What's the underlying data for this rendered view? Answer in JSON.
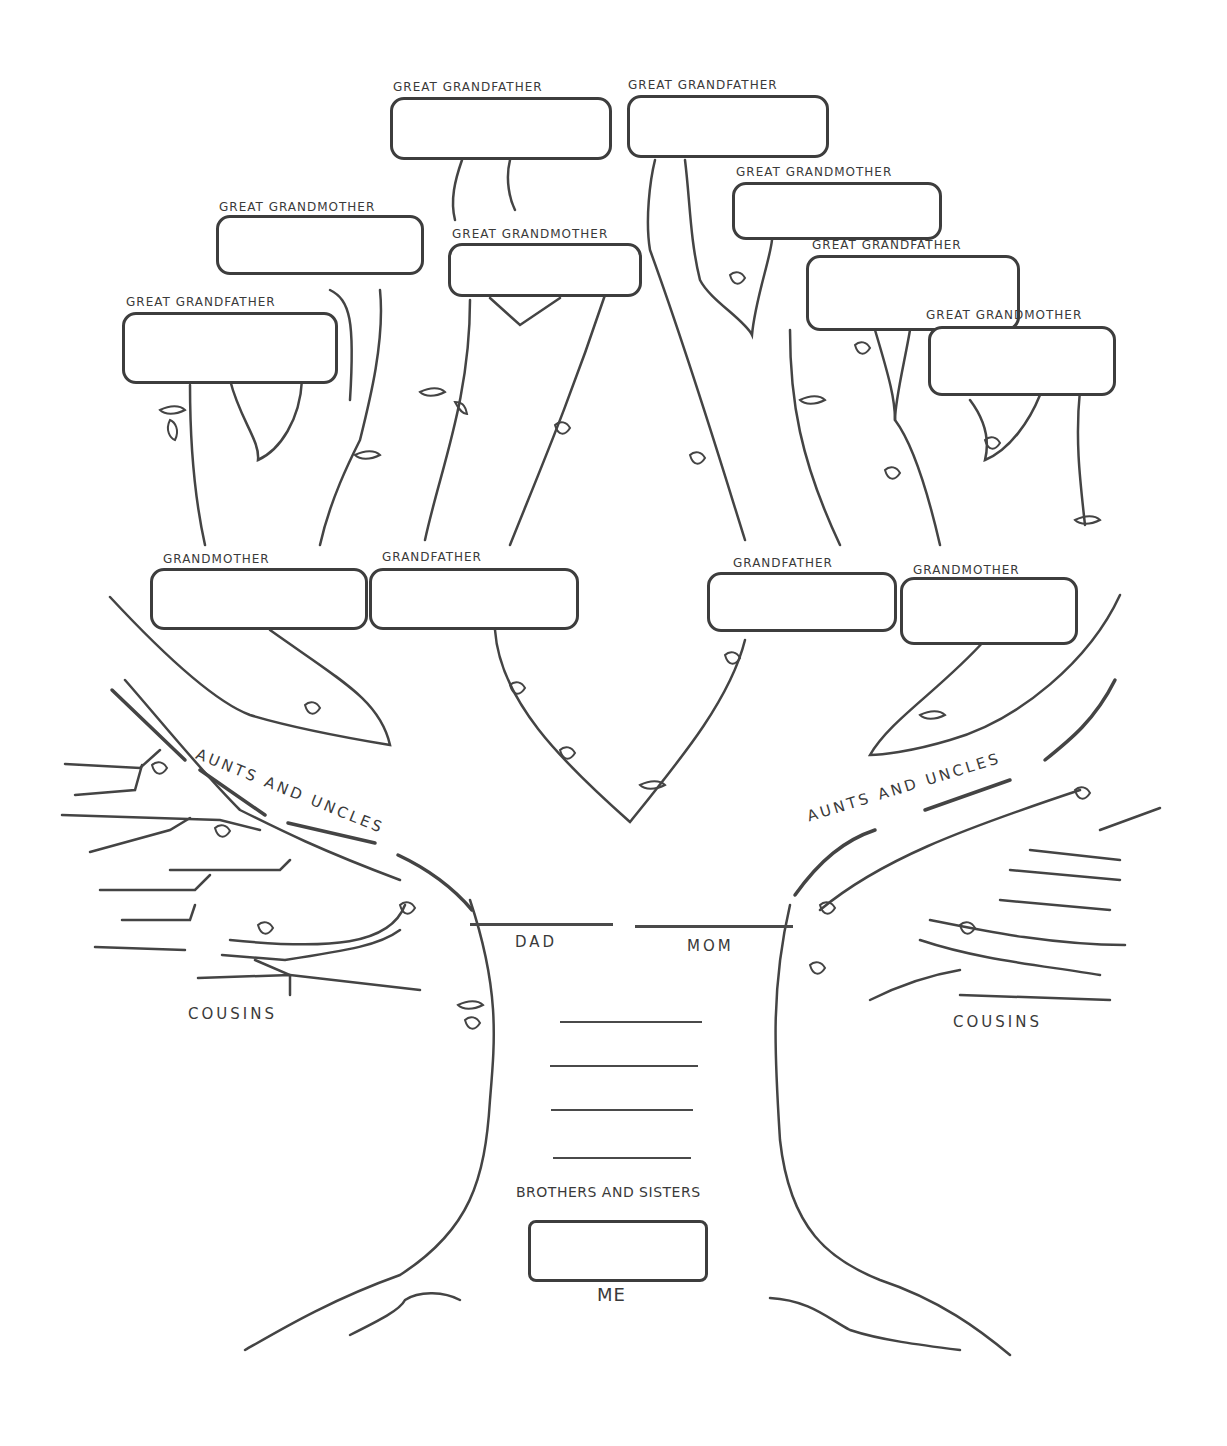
{
  "great_grandparents": [
    {
      "id": "gg1",
      "label": "GREAT GRANDFATHER"
    },
    {
      "id": "gg2",
      "label": "GREAT GRANDMOTHER"
    },
    {
      "id": "gg3",
      "label": "GREAT GRANDMOTHER"
    },
    {
      "id": "gg4",
      "label": "GREAT GRANDFATHER"
    },
    {
      "id": "gg5",
      "label": "GREAT GRANDFATHER"
    },
    {
      "id": "gg6",
      "label": "GREAT GRANDMOTHER"
    },
    {
      "id": "gg7",
      "label": "GREAT GRANDFATHER"
    },
    {
      "id": "gg8",
      "label": "GREAT GRANDMOTHER"
    }
  ],
  "grandparents": [
    {
      "id": "gp1",
      "label": "GRANDMOTHER"
    },
    {
      "id": "gp2",
      "label": "GRANDFATHER"
    },
    {
      "id": "gp3",
      "label": "GRANDFATHER"
    },
    {
      "id": "gp4",
      "label": "GRANDMOTHER"
    }
  ],
  "aunts_uncles": {
    "left": "AUNTS AND UNCLES",
    "right": "AUNTS AND UNCLES"
  },
  "cousins": {
    "left": "COUSINS",
    "right": "COUSINS"
  },
  "parents": {
    "dad": "DAD",
    "mom": "MOM"
  },
  "siblings": {
    "label": "BROTHERS AND SISTERS",
    "line_count": 4
  },
  "me": {
    "label": "ME"
  },
  "colors": {
    "ink": "#3d3d3d",
    "paper": "#ffffff"
  }
}
